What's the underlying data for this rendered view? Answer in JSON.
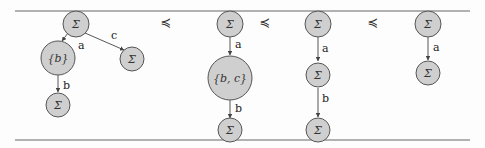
{
  "figure": {
    "relation_symbol": "≼",
    "trees": [
      {
        "nodes": [
          {
            "id": "t1n0",
            "label": "Σ"
          },
          {
            "id": "t1n1",
            "label": "{b}"
          },
          {
            "id": "t1n2",
            "label": "Σ"
          },
          {
            "id": "t1n3",
            "label": "Σ"
          }
        ],
        "edges": [
          {
            "from": "t1n0",
            "to": "t1n1",
            "label": "a"
          },
          {
            "from": "t1n0",
            "to": "t1n2",
            "label": "c"
          },
          {
            "from": "t1n1",
            "to": "t1n3",
            "label": "b"
          }
        ]
      },
      {
        "nodes": [
          {
            "id": "t2n0",
            "label": "Σ"
          },
          {
            "id": "t2n1",
            "label": "{b, c}"
          },
          {
            "id": "t2n2",
            "label": "Σ"
          }
        ],
        "edges": [
          {
            "from": "t2n0",
            "to": "t2n1",
            "label": "a"
          },
          {
            "from": "t2n1",
            "to": "t2n2",
            "label": "b"
          }
        ]
      },
      {
        "nodes": [
          {
            "id": "t3n0",
            "label": "Σ"
          },
          {
            "id": "t3n1",
            "label": "Σ"
          },
          {
            "id": "t3n2",
            "label": "Σ"
          }
        ],
        "edges": [
          {
            "from": "t3n0",
            "to": "t3n1",
            "label": "a"
          },
          {
            "from": "t3n1",
            "to": "t3n2",
            "label": "b"
          }
        ]
      },
      {
        "nodes": [
          {
            "id": "t4n0",
            "label": "Σ"
          },
          {
            "id": "t4n1",
            "label": "Σ"
          }
        ],
        "edges": [
          {
            "from": "t4n0",
            "to": "t4n1",
            "label": "a"
          }
        ]
      }
    ],
    "relations": [
      "≼",
      "≼",
      "≼"
    ]
  }
}
